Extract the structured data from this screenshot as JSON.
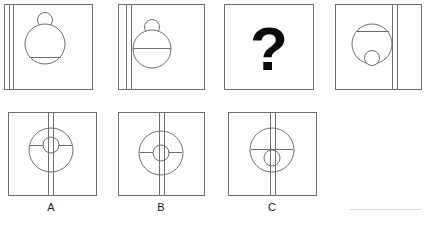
{
  "figure": {
    "kind": "visual-analogy-puzzle",
    "title": "",
    "stroke_color": "#6e6e6e",
    "stroke_color_dark": "#4a4a4a",
    "background_color": "#ffffff",
    "text_color": "#1a1a1a",
    "faint_rule_color": "#d8d8d8",
    "stroke_width": 1
  },
  "sequence": {
    "name": "top-row-sequence",
    "panels": [
      {
        "id": "panel-1",
        "position": 1,
        "box": {
          "x": 4,
          "y": 4,
          "w": 88,
          "h": 85
        },
        "stripes": {
          "orientation": "vertical",
          "count": 2,
          "x_positions": [
            9,
            13
          ],
          "side": "left"
        },
        "big_circle": {
          "cx": 45,
          "cy": 44,
          "r": 20
        },
        "chord": {
          "y": 58,
          "description": "horizontal chord near bottom of big circle"
        },
        "small_circle": {
          "cx": 45,
          "cy": 20,
          "r": 7,
          "placement": "above-top-outside"
        },
        "description": "Two vertical lines at left; large circle with low horizontal chord; small circle resting on top of the large circle."
      },
      {
        "id": "panel-2",
        "position": 2,
        "box": {
          "x": 118,
          "y": 4,
          "w": 86,
          "h": 85
        },
        "stripes": {
          "orientation": "vertical",
          "count": 2,
          "x_positions": [
            126,
            131
          ],
          "side": "left"
        },
        "big_circle": {
          "cx": 152,
          "cy": 49,
          "r": 19
        },
        "chord": {
          "y": 49,
          "description": "horizontal diameter through circle centre"
        },
        "small_circle": {
          "cx": 152,
          "cy": 27,
          "r": 7,
          "placement": "above-top-outside"
        },
        "description": "Two vertical lines at left, circle shifted right so it overlaps them; horizontal diameter; small circle on top."
      },
      {
        "id": "panel-3",
        "position": 3,
        "box": {
          "x": 224,
          "y": 4,
          "w": 89,
          "h": 85
        },
        "content": "question-mark",
        "question_mark": "?",
        "description": "The unknown panel, containing a large bold question mark."
      },
      {
        "id": "panel-4",
        "position": 4,
        "box": {
          "x": 335,
          "y": 4,
          "w": 86,
          "h": 85
        },
        "stripes": {
          "orientation": "vertical",
          "count": 2,
          "x_positions": [
            392,
            397
          ],
          "side": "right"
        },
        "big_circle": {
          "cx": 372,
          "cy": 44,
          "r": 20
        },
        "chord": {
          "y": 31,
          "description": "horizontal chord near top of big circle"
        },
        "small_circle": {
          "cx": 372,
          "cy": 59,
          "r": 7,
          "placement": "inside-bottom"
        },
        "description": "Two vertical lines at right; large circle with high horizontal chord; small circle inside at the bottom of the large circle."
      }
    ]
  },
  "options": {
    "name": "answer-options-row",
    "items": [
      {
        "id": "option-a",
        "label": "A",
        "box": {
          "x": 8,
          "y": 112,
          "w": 88,
          "h": 83
        },
        "stripes": {
          "orientation": "vertical",
          "count": 2,
          "x_positions": [
            48,
            53
          ],
          "side": "centre",
          "full_height": true
        },
        "big_circle": {
          "cx": 50,
          "cy": 150,
          "r": 22
        },
        "chord": {
          "y": 146,
          "description": "horizontal chord slightly above centre"
        },
        "small_circle": {
          "cx": 50,
          "cy": 146,
          "r": 8,
          "placement": "inside-above-centre"
        },
        "label_x": 50,
        "label_y": 210
      },
      {
        "id": "option-b",
        "label": "B",
        "box": {
          "x": 118,
          "y": 112,
          "w": 86,
          "h": 83
        },
        "stripes": {
          "orientation": "vertical",
          "count": 2,
          "x_positions": [
            159,
            164
          ],
          "side": "centre",
          "full_height": true
        },
        "big_circle": {
          "cx": 160,
          "cy": 153,
          "r": 22
        },
        "chord": {
          "y": 153,
          "description": "horizontal diameter through circle centre"
        },
        "small_circle": {
          "cx": 160,
          "cy": 153,
          "r": 8,
          "placement": "inside-centre"
        },
        "label_x": 160,
        "label_y": 210
      },
      {
        "id": "option-c",
        "label": "C",
        "box": {
          "x": 228,
          "y": 112,
          "w": 88,
          "h": 83
        },
        "stripes": {
          "orientation": "vertical",
          "count": 2,
          "x_positions": [
            270,
            275
          ],
          "side": "centre",
          "full_height": true
        },
        "big_circle": {
          "cx": 272,
          "cy": 150,
          "r": 22
        },
        "chord": {
          "y": 150,
          "description": "horizontal chord at circle centre"
        },
        "small_circle": {
          "cx": 272,
          "cy": 158,
          "r": 8,
          "placement": "inside-below-centre"
        },
        "label_x": 272,
        "label_y": 210
      }
    ]
  },
  "footer": {
    "faint_rule": {
      "x1": 350,
      "y1": 210,
      "x2": 421,
      "y2": 210,
      "visible": true
    }
  }
}
